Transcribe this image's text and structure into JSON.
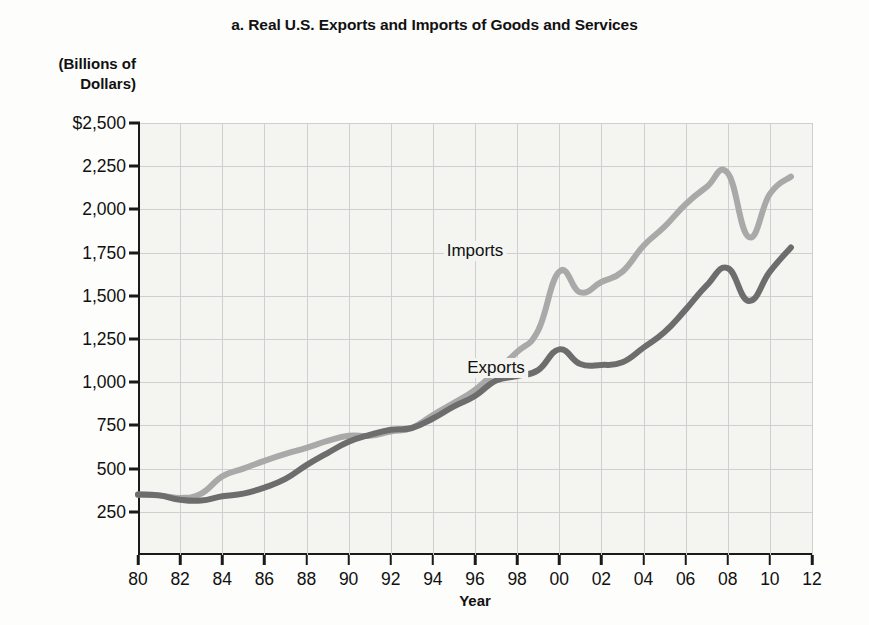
{
  "chart_data": {
    "type": "line",
    "title": "a. Real U.S. Exports and Imports of Goods and Services",
    "subtitle": "",
    "ylabel": "(Billions of\nDollars)",
    "ylabel_line1": "(Billions of",
    "ylabel_line2": "Dollars)",
    "xlabel": "Year",
    "ylim": [
      0,
      2500
    ],
    "xlim": [
      1980,
      2012
    ],
    "grid": true,
    "legend_position": "inline-annotation",
    "ytick_labels": [
      "$2,500",
      "2,250",
      "2,000",
      "1,750",
      "1,500",
      "1,250",
      "1,000",
      "750",
      "500",
      "250"
    ],
    "ytick_values": [
      2500,
      2250,
      2000,
      1750,
      1500,
      1250,
      1000,
      750,
      500,
      250
    ],
    "xtick_labels": [
      "80",
      "82",
      "84",
      "86",
      "88",
      "90",
      "92",
      "94",
      "96",
      "98",
      "00",
      "02",
      "04",
      "06",
      "08",
      "10",
      "12"
    ],
    "xtick_values": [
      1980,
      1982,
      1984,
      1986,
      1988,
      1990,
      1992,
      1994,
      1996,
      1998,
      2000,
      2002,
      2004,
      2006,
      2008,
      2010,
      2012
    ],
    "x": [
      1980,
      1981,
      1982,
      1983,
      1984,
      1985,
      1986,
      1987,
      1988,
      1989,
      1990,
      1991,
      1992,
      1993,
      1994,
      1995,
      1996,
      1997,
      1998,
      1999,
      2000,
      2001,
      2002,
      2003,
      2004,
      2005,
      2006,
      2007,
      2008,
      2009,
      2010,
      2011
    ],
    "series": [
      {
        "name": "Imports",
        "color": "#a9a9a9",
        "label_x": 1996,
        "label_y": 1760,
        "values": [
          350,
          345,
          330,
          355,
          455,
          500,
          545,
          585,
          620,
          660,
          690,
          690,
          715,
          735,
          810,
          880,
          955,
          1065,
          1175,
          1300,
          1640,
          1520,
          1580,
          1640,
          1790,
          1900,
          2030,
          2130,
          2210,
          1840,
          2090,
          2190
        ]
      },
      {
        "name": "Exports",
        "color": "#6d6d6d",
        "label_x": 1997,
        "label_y": 1080,
        "values": [
          350,
          345,
          320,
          315,
          340,
          355,
          390,
          440,
          520,
          590,
          655,
          695,
          725,
          735,
          790,
          860,
          920,
          1010,
          1035,
          1070,
          1190,
          1105,
          1100,
          1115,
          1200,
          1290,
          1420,
          1560,
          1660,
          1470,
          1640,
          1780
        ]
      }
    ]
  }
}
